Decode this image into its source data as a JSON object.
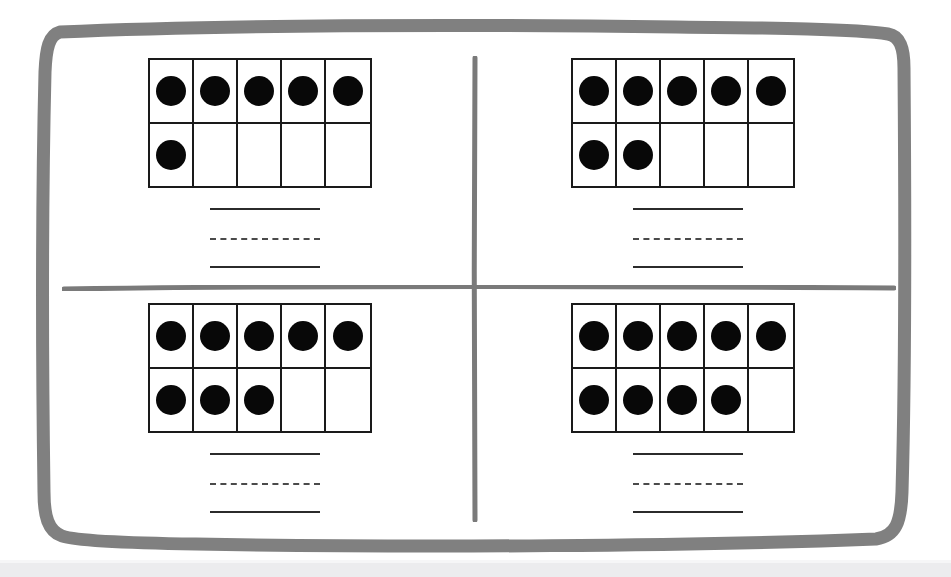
{
  "worksheet": {
    "title": "Ten Frame Addition Worksheet",
    "background_color": "#ffffff",
    "frame_color": "#808080",
    "divider_color": "#7a7a7a",
    "grid_color": "#1a1a1a",
    "counter_color": "#080808",
    "answer_line_color": "#2b2b2b",
    "dashed_line_color": "#4a4a4a",
    "columns": 5,
    "rows": 2
  },
  "problems": [
    {
      "id": "problem-1",
      "position": "top-left",
      "top_row": [
        true,
        true,
        true,
        true,
        true
      ],
      "bottom_row": [
        true,
        false,
        false,
        false,
        false
      ],
      "top_row_count": 5,
      "bottom_row_count": 1,
      "total": 6,
      "answer_lines": [
        "blank-addend-1",
        "blank-addend-2",
        "blank-sum"
      ]
    },
    {
      "id": "problem-2",
      "position": "top-right",
      "top_row": [
        true,
        true,
        true,
        true,
        true
      ],
      "bottom_row": [
        true,
        true,
        false,
        false,
        false
      ],
      "top_row_count": 5,
      "bottom_row_count": 2,
      "total": 7,
      "answer_lines": [
        "blank-addend-1",
        "blank-addend-2",
        "blank-sum"
      ]
    },
    {
      "id": "problem-3",
      "position": "bottom-left",
      "top_row": [
        true,
        true,
        true,
        true,
        true
      ],
      "bottom_row": [
        true,
        true,
        true,
        false,
        false
      ],
      "top_row_count": 5,
      "bottom_row_count": 3,
      "total": 8,
      "answer_lines": [
        "blank-addend-1",
        "blank-addend-2",
        "blank-sum"
      ]
    },
    {
      "id": "problem-4",
      "position": "bottom-right",
      "top_row": [
        true,
        true,
        true,
        true,
        true
      ],
      "bottom_row": [
        true,
        true,
        true,
        true,
        false
      ],
      "top_row_count": 5,
      "bottom_row_count": 4,
      "total": 9,
      "answer_lines": [
        "blank-addend-1",
        "blank-addend-2",
        "blank-sum"
      ]
    }
  ]
}
